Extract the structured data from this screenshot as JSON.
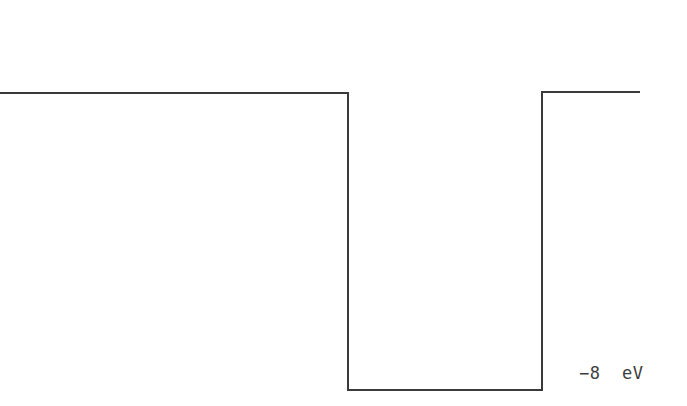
{
  "figure": {
    "background_color": "#ffffff",
    "width": 687,
    "height": 406
  },
  "well": {
    "line_color": "#3a3a3a",
    "line_width": 2,
    "path": "M 0 93 L 348 93 L 348 390 L 542 390 L 542 92 L 640 92",
    "outside_level_y": 93,
    "inside_level_y": 390,
    "left_wall_x": 348,
    "right_wall_x": 542,
    "left_plateau_start_x": 0,
    "right_plateau_end_x": 640
  },
  "labels": {
    "energy_level": "−8  eV",
    "energy_value": -8,
    "energy_unit": "eV",
    "energy_label_color": "#3d3d3d"
  },
  "chart_data": {
    "type": "line",
    "title": "",
    "xlabel": "",
    "ylabel": "",
    "annotations": [
      "−8  eV"
    ],
    "series": [
      {
        "name": "potential",
        "x": [
          0,
          348,
          348,
          542,
          542,
          640
        ],
        "y": [
          0,
          0,
          -8,
          -8,
          0,
          0
        ]
      }
    ],
    "ylim": [
      -8,
      0
    ],
    "grid": false,
    "legend": false
  }
}
